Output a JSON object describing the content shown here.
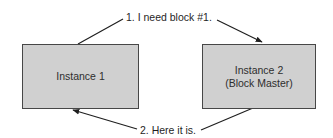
{
  "diagram": {
    "nodes": [
      {
        "id": "instance1",
        "lines": [
          "Instance 1"
        ]
      },
      {
        "id": "instance2",
        "lines": [
          "Instance 2",
          "(Block Master)"
        ]
      }
    ],
    "edges": [
      {
        "from": "instance1",
        "to": "instance2",
        "label": "1. I need block #1."
      },
      {
        "from": "instance2",
        "to": "instance1",
        "label": "2. Here it is."
      }
    ],
    "colors": {
      "box_fill": "#d0d0d0",
      "box_border": "#474747",
      "line": "#1f1f1f",
      "text": "#2e2e2e"
    }
  }
}
